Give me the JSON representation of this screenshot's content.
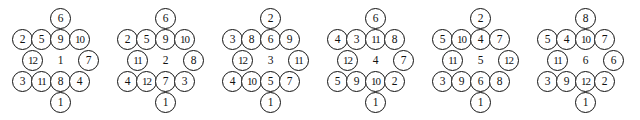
{
  "diagram": {
    "type": "hexagonal-node-arrangement-series",
    "figure_count": 6,
    "node_count_per_figure": 14,
    "geometry": {
      "figure_pitch_px": 105,
      "circle_diameter_px": 21,
      "row_spacing_px": 21,
      "col_spacing_px": 19,
      "rows": [
        {
          "index": 0,
          "count": 1,
          "y": 8,
          "x_starts": [
            50
          ]
        },
        {
          "index": 1,
          "count": 4,
          "y": 29,
          "x_starts": [
            12,
            31,
            50,
            69
          ]
        },
        {
          "index": 2,
          "count": 3,
          "y": 50,
          "x_starts": [
            22,
            50,
            78
          ]
        },
        {
          "index": 3,
          "count": 4,
          "y": 71,
          "x_starts": [
            12,
            31,
            50,
            69
          ]
        },
        {
          "index": 4,
          "count": 1,
          "y": 92,
          "x_starts": [
            50
          ]
        }
      ]
    },
    "stroke_color": "#111111",
    "fill_color": "#ffffff",
    "text_color": "#111111",
    "figures": [
      {
        "name": "figure-1",
        "x": 0,
        "center_value": "1",
        "rows": [
          {
            "circled": true,
            "values": [
              "6"
            ]
          },
          {
            "circled": true,
            "values": [
              "2",
              "5",
              "9",
              "10"
            ]
          },
          {
            "circled": [
              true,
              false,
              true
            ],
            "values": [
              "12",
              "1",
              "7"
            ]
          },
          {
            "circled": true,
            "values": [
              "3",
              "11",
              "8",
              "4"
            ]
          },
          {
            "circled": true,
            "values": [
              "1"
            ]
          }
        ]
      },
      {
        "name": "figure-2",
        "x": 105,
        "center_value": "2",
        "rows": [
          {
            "circled": true,
            "values": [
              "6"
            ]
          },
          {
            "circled": true,
            "values": [
              "2",
              "5",
              "9",
              "10"
            ]
          },
          {
            "circled": [
              true,
              false,
              true
            ],
            "values": [
              "11",
              "2",
              "8"
            ]
          },
          {
            "circled": true,
            "values": [
              "4",
              "12",
              "7",
              "3"
            ]
          },
          {
            "circled": true,
            "values": [
              "1"
            ]
          }
        ]
      },
      {
        "name": "figure-3",
        "x": 210,
        "center_value": "3",
        "rows": [
          {
            "circled": true,
            "values": [
              "2"
            ]
          },
          {
            "circled": true,
            "values": [
              "3",
              "8",
              "6",
              "9"
            ]
          },
          {
            "circled": [
              true,
              false,
              true
            ],
            "values": [
              "12",
              "3",
              "11"
            ]
          },
          {
            "circled": true,
            "values": [
              "4",
              "10",
              "5",
              "7"
            ]
          },
          {
            "circled": true,
            "values": [
              "1"
            ]
          }
        ]
      },
      {
        "name": "figure-4",
        "x": 315,
        "center_value": "4",
        "rows": [
          {
            "circled": true,
            "values": [
              "6"
            ]
          },
          {
            "circled": true,
            "values": [
              "4",
              "3",
              "11",
              "8"
            ]
          },
          {
            "circled": [
              true,
              false,
              true
            ],
            "values": [
              "12",
              "4",
              "7"
            ]
          },
          {
            "circled": true,
            "values": [
              "5",
              "9",
              "10",
              "2"
            ]
          },
          {
            "circled": true,
            "values": [
              "1"
            ]
          }
        ]
      },
      {
        "name": "figure-5",
        "x": 420,
        "center_value": "5",
        "rows": [
          {
            "circled": true,
            "values": [
              "2"
            ]
          },
          {
            "circled": true,
            "values": [
              "5",
              "10",
              "4",
              "7"
            ]
          },
          {
            "circled": [
              true,
              false,
              true
            ],
            "values": [
              "11",
              "5",
              "12"
            ]
          },
          {
            "circled": true,
            "values": [
              "3",
              "9",
              "6",
              "8"
            ]
          },
          {
            "circled": true,
            "values": [
              "1"
            ]
          }
        ]
      },
      {
        "name": "figure-6",
        "x": 525,
        "center_value": "6",
        "rows": [
          {
            "circled": true,
            "values": [
              "8"
            ]
          },
          {
            "circled": true,
            "values": [
              "5",
              "4",
              "10",
              "7"
            ]
          },
          {
            "circled": [
              true,
              false,
              true
            ],
            "values": [
              "11",
              "6",
              "6"
            ]
          },
          {
            "circled": true,
            "values": [
              "3",
              "9",
              "12",
              "2"
            ]
          },
          {
            "circled": true,
            "values": [
              "1"
            ]
          }
        ]
      }
    ]
  }
}
